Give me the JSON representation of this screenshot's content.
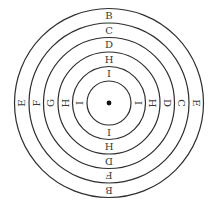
{
  "diagram": {
    "type": "concentric-rings",
    "center": {
      "x": 109,
      "y": 103
    },
    "center_dot_radius": 2.4,
    "colors": {
      "stroke": "#2e2e2e",
      "text": "#3a3a3a",
      "dot": "#111111",
      "background": "#ffffff"
    },
    "rings": [
      {
        "r": 22
      },
      {
        "r": 36.5
      },
      {
        "r": 51
      },
      {
        "r": 65.5
      },
      {
        "r": 80
      },
      {
        "r": 94.5
      }
    ],
    "bands": [
      {
        "index": 1,
        "top": "I",
        "right": "I",
        "bottom": "I",
        "left": "I"
      },
      {
        "index": 2,
        "top": "H",
        "right": "H",
        "bottom": "H",
        "left": "H"
      },
      {
        "index": 3,
        "top": "D",
        "right": "D",
        "bottom": "D",
        "left": "G"
      },
      {
        "index": 4,
        "top": "C",
        "right": "C",
        "bottom": "F",
        "left": "F"
      },
      {
        "index": 5,
        "top": "B",
        "right": "E",
        "bottom": "B",
        "left": "E"
      }
    ]
  }
}
